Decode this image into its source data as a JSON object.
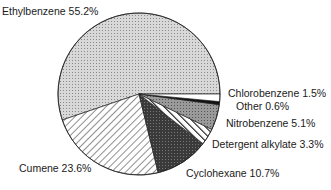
{
  "chart_data": {
    "type": "pie",
    "title": "",
    "categories": [
      "Ethylbenzene",
      "Cumene",
      "Cyclohexane",
      "Detergent alkylate",
      "Nitrobenzene",
      "Other",
      "Chlorobenzene"
    ],
    "values": [
      55.2,
      23.6,
      10.7,
      3.3,
      5.1,
      0.6,
      1.5
    ],
    "unit": "%",
    "labels": [
      {
        "text": "Ethylbenzene 55.2%"
      },
      {
        "text": "Cumene 23.6%"
      },
      {
        "text": "Cyclohexane 10.7%"
      },
      {
        "text": "Detergent alkylate 3.3%"
      },
      {
        "text": "Nitrobenzene 5.1%"
      },
      {
        "text": "Other 0.6%"
      },
      {
        "text": "Chlorobenzene 1.5%"
      }
    ],
    "legend": "none (direct labels)",
    "grid": false
  }
}
